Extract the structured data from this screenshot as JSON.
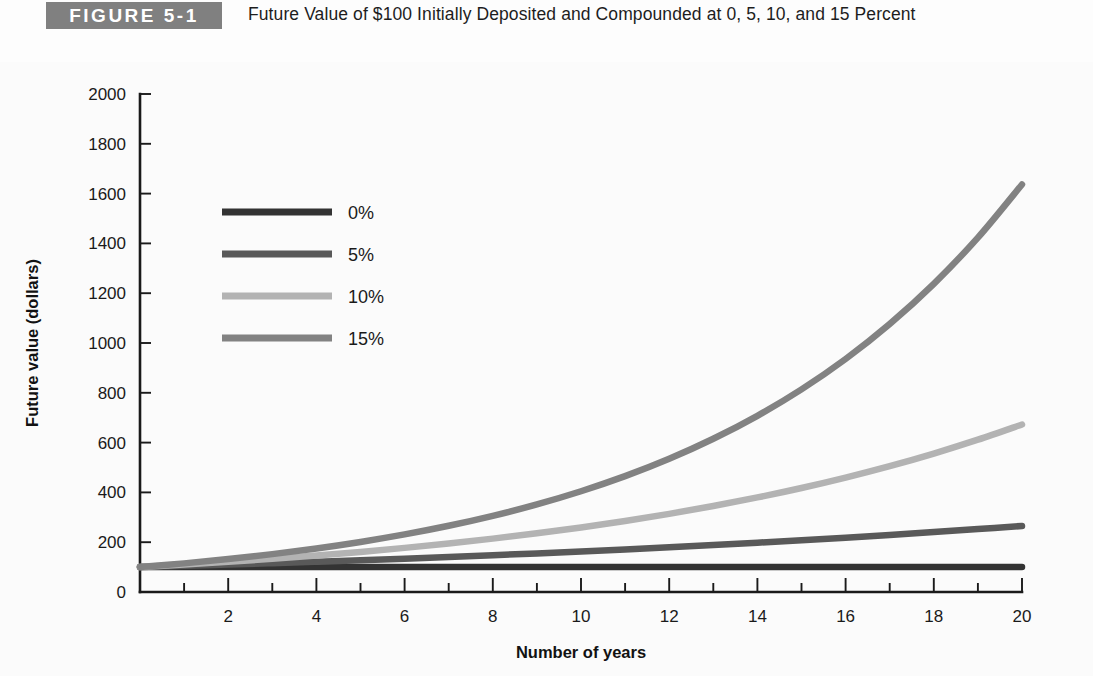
{
  "figure": {
    "badge": "FIGURE 5-1",
    "title": "Future Value of $100 Initially Deposited and Compounded at 0, 5, 10, and 15 Percent",
    "badge_bg": "#808080",
    "background": "#fbfbfb"
  },
  "chart_data": {
    "type": "line",
    "title": "Future Value of $100 Initially Deposited and Compounded at 0, 5, 10, and 15 Percent",
    "xlabel": "Number of years",
    "ylabel": "Future value (dollars)",
    "xlim": [
      0,
      20
    ],
    "ylim": [
      0,
      2000
    ],
    "grid": false,
    "legend_position": "upper-left-inside",
    "x_major_ticks": [
      0,
      2,
      4,
      6,
      8,
      10,
      12,
      14,
      16,
      18,
      20
    ],
    "x_tick_labels": [
      "",
      "2",
      "4",
      "6",
      "8",
      "10",
      "12",
      "14",
      "16",
      "18",
      "20"
    ],
    "x_minor_ticks": [
      1,
      3,
      5,
      7,
      9,
      11,
      13,
      15,
      17,
      19
    ],
    "y_ticks": [
      0,
      200,
      400,
      600,
      800,
      1000,
      1200,
      1400,
      1600,
      1800,
      2000
    ],
    "y_tick_labels": [
      "0",
      "200",
      "400",
      "600",
      "800",
      "1000",
      "1200",
      "1400",
      "1600",
      "1800",
      "2000"
    ],
    "x": [
      0,
      1,
      2,
      3,
      4,
      5,
      6,
      7,
      8,
      9,
      10,
      11,
      12,
      13,
      14,
      15,
      16,
      17,
      18,
      19,
      20
    ],
    "series": [
      {
        "name": "0%",
        "rate": 0,
        "color": "#333333",
        "values": [
          100,
          100,
          100,
          100,
          100,
          100,
          100,
          100,
          100,
          100,
          100,
          100,
          100,
          100,
          100,
          100,
          100,
          100,
          100,
          100,
          100
        ]
      },
      {
        "name": "5%",
        "rate": 5,
        "color": "#595959",
        "values": [
          100,
          105,
          110.3,
          115.8,
          121.6,
          127.6,
          134,
          140.7,
          147.7,
          155.1,
          162.9,
          171,
          179.6,
          188.6,
          198,
          207.9,
          218.3,
          229.2,
          240.7,
          252.7,
          265.3
        ]
      },
      {
        "name": "10%",
        "rate": 10,
        "color": "#b3b3b3",
        "values": [
          100,
          110,
          121,
          133.1,
          146.4,
          161.1,
          177.2,
          194.9,
          214.4,
          235.8,
          259.4,
          285.3,
          313.8,
          345.2,
          379.8,
          417.7,
          459.5,
          505.4,
          556,
          611.6,
          672.7
        ]
      },
      {
        "name": "15%",
        "rate": 15,
        "color": "#828282",
        "values": [
          100,
          115,
          132.3,
          152.1,
          174.9,
          201.1,
          231.3,
          266,
          305.9,
          351.8,
          404.6,
          465.2,
          535.0,
          615.3,
          707.6,
          813.7,
          935.8,
          1076.3,
          1237.7,
          1423.2,
          1636.7
        ]
      }
    ]
  }
}
